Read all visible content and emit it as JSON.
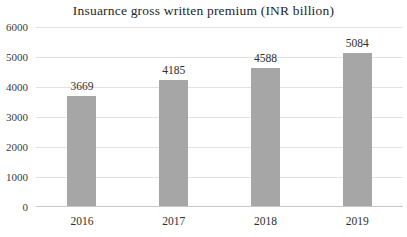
{
  "chart_data": {
    "type": "bar",
    "title": "Insuarnce gross written premium (INR billion)",
    "categories": [
      "2016",
      "2017",
      "2018",
      "2019"
    ],
    "values": [
      3669,
      4185,
      4588,
      5084
    ],
    "xlabel": "",
    "ylabel": "",
    "ylim": [
      0,
      6000
    ],
    "yticks": [
      0,
      1000,
      2000,
      3000,
      4000,
      5000,
      6000
    ],
    "grid": true,
    "legend": false,
    "bar_color": "#a6a6a6",
    "gridline_color": "#e2e2e2",
    "axis_line_color": "#c8c8c8",
    "title_color": "#262626",
    "tick_label_color": "#3a3a3a"
  }
}
